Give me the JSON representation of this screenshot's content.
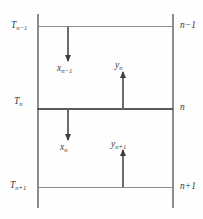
{
  "diagram": {
    "left_labels": [
      {
        "name": "temperature-above",
        "base": "T",
        "sub": "n−1"
      },
      {
        "name": "temperature-stage",
        "base": "T",
        "sub": "n"
      },
      {
        "name": "temperature-below",
        "base": "T",
        "sub": "n+1"
      }
    ],
    "right_labels": [
      {
        "name": "stage-index-above",
        "text": "n−1"
      },
      {
        "name": "stage-index-current",
        "text": "n"
      },
      {
        "name": "stage-index-below",
        "text": "n+1"
      }
    ],
    "flow_labels": [
      {
        "name": "liquid-flow-above",
        "base": "x",
        "sub": "n−1",
        "direction": "down"
      },
      {
        "name": "vapor-flow-stage",
        "base": "y",
        "sub": "n",
        "direction": "up"
      },
      {
        "name": "liquid-flow-stage",
        "base": "x",
        "sub": "n",
        "direction": "down"
      },
      {
        "name": "vapor-flow-below",
        "base": "y",
        "sub": "n+1",
        "direction": "up"
      }
    ],
    "colors": {
      "line": "#8c8c8c",
      "tray_highlight": "#5a5a5a",
      "arrow": "#3d3d3d",
      "text": "#3a3a3a",
      "background": "#fefefe"
    }
  }
}
